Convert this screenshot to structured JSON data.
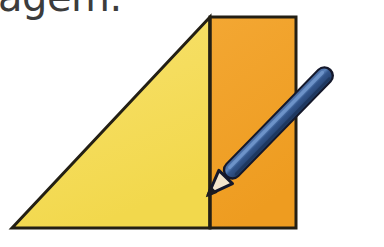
{
  "page": {
    "background_color": "#ffffff",
    "width": 384,
    "height": 247
  },
  "caption": {
    "text_fragment": "agem.",
    "color": "#3c3c3c",
    "note": "partially cropped line of text at top-left edge"
  },
  "figure": {
    "name": "ramp-with-pencil-illustration",
    "shapes": [
      {
        "id": "yellow-triangle",
        "label": "yellow-right-triangle",
        "type": "polygon",
        "fill": "#F5DE5A",
        "stroke": "#231F14",
        "stroke_width": 3,
        "points": "12,228 210,228 210,17"
      },
      {
        "id": "orange-rectangle",
        "label": "orange-rectangle",
        "type": "rect",
        "fill": "#F0A128",
        "stroke": "#231F14",
        "stroke_width": 3,
        "x": 210,
        "y": 17,
        "width": 86,
        "height": 211
      },
      {
        "id": "shared-edge",
        "label": "shared-vertical-edge",
        "type": "line",
        "stroke": "#231F14",
        "stroke_width": 3,
        "x1": 210,
        "y1": 17,
        "x2": 210,
        "y2": 228
      }
    ],
    "pencil": {
      "id": "blue-pencil",
      "label": "blue-pencil",
      "body_color": "#2F5283",
      "body_shade_color": "#24406B",
      "highlight_color": "#5C84BC",
      "outline_color": "#14182B",
      "wood_tip_color": "#F4E6CC",
      "graphite_color": "#1B1B20",
      "tip_point": [
        211,
        192
      ],
      "butt_point": [
        358,
        41
      ],
      "angle_degrees": -45.7,
      "barrel_width": 17
    }
  }
}
